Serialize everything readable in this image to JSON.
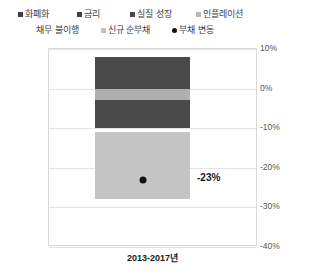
{
  "legend": {
    "rows": [
      [
        {
          "label": "화폐화",
          "marker": "square",
          "color": "#404040"
        },
        {
          "label": "금리",
          "marker": "square",
          "color": "#404040"
        },
        {
          "label": "실질 성장",
          "marker": "square",
          "color": "#4a4a4a"
        },
        {
          "label": "인플레이션",
          "marker": "square",
          "color": "#b8b8b8"
        }
      ],
      [
        {
          "label": "채무 불이행",
          "marker": "none",
          "color": "#ffffff"
        },
        {
          "label": "신규 순부채",
          "marker": "square",
          "color": "#c2c2c2"
        },
        {
          "label": "부채 변동",
          "marker": "dot",
          "color": "#111111"
        }
      ]
    ]
  },
  "axes": {
    "y_title": "총 부채 변화(%GDP 연간)",
    "y_ticks": [
      "10%",
      "0%",
      "-10%",
      "-20%",
      "-30%",
      "-40%"
    ],
    "y_values": [
      10,
      0,
      -10,
      -20,
      -30,
      -40
    ],
    "x_label": "2013-2017년"
  },
  "data_label": "-23%",
  "chart_data": {
    "type": "bar",
    "title": "",
    "subtitle": "",
    "xlabel": "2013-2017년",
    "ylabel": "총 부채 변화(%GDP 연간)",
    "categories": [
      "2013-2017년"
    ],
    "ylim": [
      -40,
      10
    ],
    "ytick_values": [
      10,
      0,
      -10,
      -20,
      -30,
      -40
    ],
    "ytick_labels": [
      "10%",
      "0%",
      "-10%",
      "-20%",
      "-30%",
      "-40%"
    ],
    "grid": true,
    "legend_position": "top",
    "stacked": true,
    "series": [
      {
        "name": "인플레이션",
        "color": "#4a4a4a",
        "values": [
          8.0
        ],
        "y_from": 8.0,
        "y_to": 0.0
      },
      {
        "name": "실질 성장",
        "color": "#b0b0b0",
        "values": [
          -3.0
        ],
        "y_from": 0.0,
        "y_to": -3.0
      },
      {
        "name": "금리",
        "color": "#4a4a4a",
        "values": [
          -7.0
        ],
        "y_from": -3.0,
        "y_to": -10.0
      },
      {
        "name": "신규 순부채",
        "color": "#c4c4c4",
        "values": [
          -17.0
        ],
        "y_from": -11.0,
        "y_to": -28.0
      }
    ],
    "markers": [
      {
        "name": "부채 변동",
        "x": "2013-2017년",
        "y": -23,
        "label": "-23%",
        "color": "#111111",
        "shape": "circle"
      }
    ],
    "annotations": [
      {
        "text": "-23%",
        "x": "2013-2017년",
        "y": -23
      }
    ]
  }
}
